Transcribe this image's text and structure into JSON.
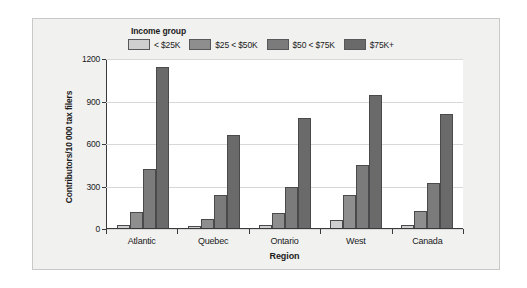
{
  "chart_data": {
    "type": "bar",
    "title": "",
    "xlabel": "Region",
    "ylabel": "Contributors/10 000 tax filers",
    "categories": [
      "Atlantic",
      "Quebec",
      "Ontario",
      "West",
      "Canada"
    ],
    "series": [
      {
        "name": "< $25K",
        "values": [
          20,
          15,
          22,
          60,
          22
        ],
        "color": "#cfcfcf"
      },
      {
        "name": "$25 < $50K",
        "values": [
          115,
          65,
          105,
          235,
          118
        ],
        "color": "#8e8e8e"
      },
      {
        "name": "$50 < $75K",
        "values": [
          420,
          230,
          290,
          445,
          315
        ],
        "color": "#7b7b7b"
      },
      {
        "name": "$75K+",
        "values": [
          1140,
          660,
          775,
          940,
          805
        ],
        "color": "#6a6a6a"
      }
    ],
    "legend_title": "Income group",
    "legend_position": "top",
    "ylim": [
      0,
      1200
    ],
    "yticks": [
      0,
      300,
      600,
      900,
      1200
    ],
    "ytick_labels": [
      "0",
      "300",
      "600",
      "900",
      "1200"
    ],
    "grid": true,
    "grid_axis": "y",
    "bar_grouping": "grouped"
  },
  "figure": {
    "background_color": "#f1f1f0",
    "plot_background_color": "#ffffff",
    "frame_color": "#c9c9c7",
    "gridline_color": "#d8d8d8",
    "axis_color": "#3a3a3a"
  }
}
